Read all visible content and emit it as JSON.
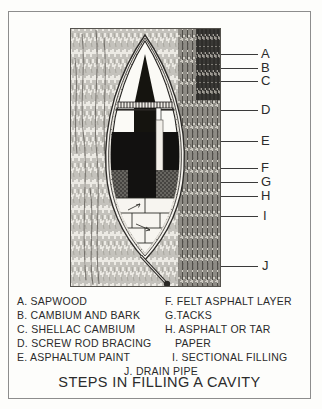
{
  "title": "STEPS IN FILLING A CAVITY",
  "illustration": {
    "alt_name": "tree-cavity-cross-section",
    "subject": "cross-section of a tree trunk cavity filled in layers"
  },
  "callouts": [
    {
      "letter": "A",
      "y": 54,
      "line_x": 221,
      "line_w": 37
    },
    {
      "letter": "B",
      "y": 68,
      "line_x": 221,
      "line_w": 37
    },
    {
      "letter": "C",
      "y": 81,
      "line_x": 221,
      "line_w": 37
    },
    {
      "letter": "D",
      "y": 110,
      "line_x": 221,
      "line_w": 37
    },
    {
      "letter": "E",
      "y": 141,
      "line_x": 221,
      "line_w": 37
    },
    {
      "letter": "F",
      "y": 168,
      "line_x": 221,
      "line_w": 37
    },
    {
      "letter": "G",
      "y": 182,
      "line_x": 221,
      "line_w": 37
    },
    {
      "letter": "H",
      "y": 196,
      "line_x": 221,
      "line_w": 37
    },
    {
      "letter": "I",
      "y": 216,
      "line_x": 221,
      "line_w": 37
    },
    {
      "letter": "J",
      "y": 266,
      "line_x": 221,
      "line_w": 37
    }
  ],
  "legend": {
    "rows": [
      {
        "left": "A. SAPWOOD",
        "right": "F. FELT  ASPHALT  LAYER"
      },
      {
        "left": "B. CAMBIUM  AND  BARK",
        "right": "G.TACKS"
      },
      {
        "left": "C. SHELLAC CAMBIUM",
        "right": "H. ASPHALT  OR  TAR"
      },
      {
        "left": "D. SCREW ROD BRACING",
        "right": "PAPER"
      },
      {
        "left": "E. ASPHALTUM  PAINT",
        "right": "I. SECTIONAL  FILLING"
      }
    ],
    "center_row": "J. DRAIN  PIPE"
  },
  "colors": {
    "ink": "#2b2b2b",
    "frame": "#8d8d8d",
    "paper": "#fdfdfb",
    "panel_bg": "#f4f2ee",
    "dark_fill": "#111111"
  }
}
